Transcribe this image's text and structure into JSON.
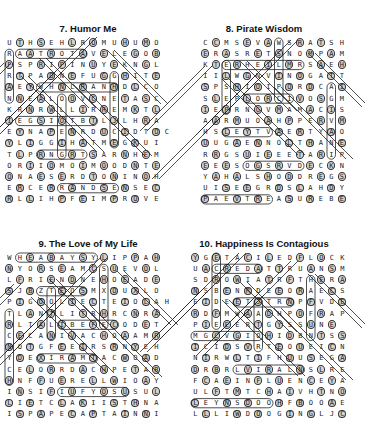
{
  "puzzles": [
    {
      "number": 7,
      "title": "7. Humor Me",
      "rows": [
        "UTHSEHLROMUHUMO",
        "RAATROTAVELEGOB",
        "FSPRIPINUYEKNGL",
        "RTPAONEFUGGHITE",
        "AEYWHNLRANHDLCO",
        "NNEALOOVCNETASC",
        "KRNRWLLIRREMKTL",
        "IEGSIOTBTLJLHRA",
        "EYNAPENRDUCIDTOC",
        "YLIGGIHATMEGKUI",
        "TLPRNGRTSARNHEM",
        "ORIIOMOIMOODNTE",
        "ONAESERDTONINOH",
        "ERCERRANDSENSEC",
        "RLLIHPFEIMPROVE"
      ],
      "found_words": [
        "HUMOR",
        "LEVATOR",
        "KEYUN",
        "FRANK",
        "TASTE",
        "HAPPY",
        "GIGGLE",
        "REMARK",
        "MOOD",
        "DESERT",
        "ERRAND",
        "SENSE",
        "IMPROVE",
        "LACIMEH",
        "CLOWN"
      ]
    },
    {
      "number": 8,
      "title": "8. Pirate Wisdom",
      "rows": [
        "CCMSEVAWSRATSH",
        "ERASRETSNOMPAM",
        "KTERHEILMRSAEH",
        "IILWGNVINOGATT",
        "SPSHIOIPORDCAI",
        "SLEPLORCIVOSGM",
        "IEPRNGVMAMACIS",
        "AARMUOAHPPERVM",
        "HSLEYTVAERTYAO",
        "UUGAENNOLTHANE",
        "RRGSUIEEETARIP",
        "EEESOGSRVDECKN",
        "YAHALSHODDREGS",
        "UISEEGRDSLAHDY",
        "PAEVTREASUREBE"
      ],
      "found_words": [
        "WAVES",
        "STARS",
        "MONSTERS",
        "MAP",
        "KISS",
        "PLEASURE",
        "ETAGMS",
        "PIRATE",
        "DECK",
        "DREGS",
        "AHOY",
        "TREASURE",
        "GROG",
        "SHIP"
      ]
    },
    {
      "number": 9,
      "title": "9. The Love of My Life",
      "rows": [
        "WHEABAYSYLIPPAH",
        "NYORSEAMCSUEVOL",
        "LFRIENDNEHOEADE",
        "SJBZTEOSMXOUXLO",
        "PIGOOLIECTEIOLAH",
        "TLANTLITRHRCNRA",
        "RLTALIBEFECODET",
        "CECANIVACHOAAMR",
        "NOTGFEEIRSRNYEH",
        "YDEXIRAMTACWOAD",
        "CELORRDACHPETAR",
        "HNFFUERELLWIOAY",
        "INSIFIUFYOSUSUL",
        "LIETCLAKIISTHNA",
        "ISPAPECAPTAINNI"
      ],
      "found_words": [
        "BAY",
        "HAPPILY",
        "SEA",
        "LOVE",
        "FRIEND",
        "DELAR",
        "EOHATE",
        "JASMINE",
        "CHILI",
        "CAPTAIN",
        "LAKI",
        "MAXIMILIAN",
        "EXTRAMARITAL"
      ]
    },
    {
      "number": 10,
      "title": "10. Happiness Is Contagious",
      "rows": [
        "YGETACILEDFLOCK",
        "UACREDATTRUANSM",
        "SDROWIATRFTHERA",
        "NSBENRDEEORAECS",
        "EIDEETJTRNPFVDE",
        "RDFMWAADHPOFRAP",
        "PIEEERTGYSSUNE",
        "MGCVGIOHIDBNTSS",
        "ICIDSVRTEOUEICN",
        "NIRWLTIFHUUSEGA",
        "DRBRLVIRALNSLRE",
        "FCAEINFLUENCEYA",
        "ULFTMTCHAIVHTNO",
        "LEYNSDOOHFBOOAE",
        "LLLIWDOOGINGLJC"
      ],
      "found_words": [
        "DELICATE",
        "FLOCK",
        "WORDS",
        "HAPPY",
        "MINDFUL",
        "VIRAL",
        "INFLUENCE",
        "HOOD",
        "GOODWILL",
        "CHAI",
        "HEART",
        "DISTRIBUTE"
      ]
    }
  ]
}
